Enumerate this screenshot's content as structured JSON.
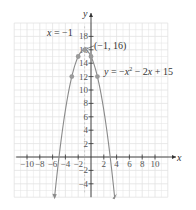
{
  "chart_data": {
    "type": "line",
    "title": "",
    "equation": "y = −x² − 2x + 15",
    "axis_of_symmetry": "x = −1",
    "vertex": {
      "x": -1,
      "y": 16,
      "label": "(−1, 16)"
    },
    "xlabel": "x",
    "ylabel": "y",
    "xlim": [
      -12,
      12
    ],
    "ylim": [
      -6,
      20
    ],
    "grid": true,
    "x_ticks": [
      -10,
      -8,
      -6,
      -4,
      -2,
      2,
      4,
      6,
      8,
      10
    ],
    "x_tick_labels": [
      "−10",
      "−8",
      "−6",
      "−4",
      "−2",
      "2",
      "4",
      "6",
      "8",
      "10"
    ],
    "y_ticks": [
      -4,
      -2,
      2,
      4,
      6,
      8,
      10,
      12,
      14,
      16,
      18
    ],
    "y_tick_labels": [
      "−4",
      "−2",
      "2",
      "4",
      "6",
      "8",
      "10",
      "12",
      "14",
      "16",
      "18"
    ],
    "points": [
      {
        "x": -3,
        "y": 12
      },
      {
        "x": -2,
        "y": 15
      },
      {
        "x": -1,
        "y": 16
      },
      {
        "x": 0,
        "y": 15
      },
      {
        "x": 1,
        "y": 12
      }
    ],
    "series": [
      {
        "name": "y = −x² − 2x + 15",
        "function": "-x^2-2x+15",
        "x_range": [
          -5.69,
          3.69
        ],
        "color": "#888888"
      }
    ]
  },
  "labels": {
    "x_axis": "x",
    "y_axis": "y",
    "axis_of_symmetry": "x = −1",
    "vertex": "(−1, 16)",
    "equation_prefix": "y = −x",
    "equation_exp": "2",
    "equation_suffix": " − 2x + 15"
  },
  "colors": {
    "grid": "#e2e2e2",
    "axis": "#333333",
    "curve": "#8a8a8a",
    "point": "#9a9a9a",
    "dash": "#bbbbbb"
  }
}
